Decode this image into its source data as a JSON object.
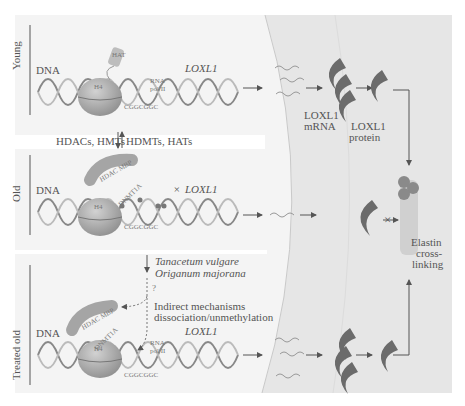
{
  "figure": {
    "panels": [
      {
        "id": "young",
        "row_label": "Young",
        "dna_label": "DNA",
        "histone_label": "H4",
        "modifier_label": "HAT",
        "polymerase_label": "RNA\npol II",
        "polymerase_line1": "RNA",
        "polymerase_line2": "pol II",
        "cpg_sequence": "CGGCGGC",
        "gene_label": "LOXL1",
        "mrna_label_line1": "LOXL1",
        "mrna_label_line2": "mRNA",
        "protein_label_line1": "LOXL1",
        "protein_label_line2": "protein"
      },
      {
        "id": "old",
        "row_label": "Old",
        "dna_label": "DNA",
        "histone_label": "H4",
        "modifier_label": "HDAC MBP",
        "methyltransferase_label": "DNMT1A",
        "cpg_sequence": "CGGCGGC",
        "gene_label": "LOXL1",
        "gene_prefix": "×"
      },
      {
        "id": "treated-old",
        "row_label": "Treated old",
        "dna_label": "DNA",
        "histone_label": "H4",
        "modifier_label": "HDAC MBP",
        "methyltransferase_label": "DNMT1A",
        "polymerase_line1": "RNA",
        "polymerase_line2": "pol II",
        "cpg_sequence": "CGGCGGC",
        "gene_label": "LOXL1"
      }
    ],
    "transition_young_old": {
      "left": "HDACs, HMTs",
      "right": "HDMTs, HATs"
    },
    "treatment": {
      "compound1": "Tanacetum vulgare",
      "compound2": "Origanum majorana",
      "question": "?",
      "mechanism_line1": "Indirect mechanisms",
      "mechanism_line2": "dissociation/unmethylation"
    },
    "outcome": {
      "line1": "Elastin",
      "line2": "cross-",
      "line3": "linking",
      "blocked_symbol": "×"
    },
    "colors": {
      "background": "#ffffff",
      "panel": "#f3f3f3",
      "extracellular": "#e4e4e4",
      "protein": "#6b6b6b",
      "dna": "#8a8a8a",
      "histone": "#a0a0a0",
      "text": "#555555"
    }
  }
}
